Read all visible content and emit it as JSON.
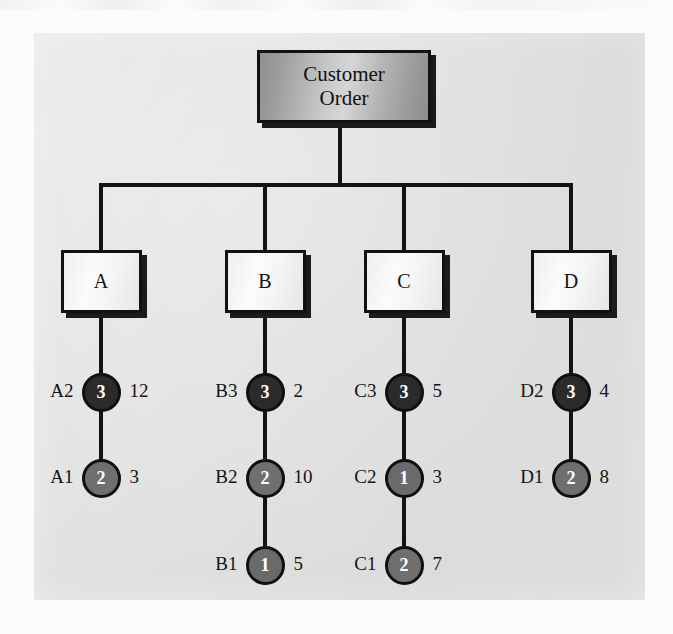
{
  "figure": {
    "panel_background": "#e4e4e4",
    "line_color": "#131313"
  },
  "root": {
    "label_line1": "Customer",
    "label_line2": "Order",
    "fill": "#c0c0c0"
  },
  "branches": [
    {
      "box_label": "A",
      "x_center": 101,
      "items": [
        {
          "id": "A2",
          "level": "3",
          "qty": "12",
          "fill": "#2b2b2b",
          "y": 392
        },
        {
          "id": "A1",
          "level": "2",
          "qty": "3",
          "fill": "#6f6f6f",
          "y": 478
        }
      ]
    },
    {
      "box_label": "B",
      "x_center": 265,
      "items": [
        {
          "id": "B3",
          "level": "3",
          "qty": "2",
          "fill": "#2b2b2b",
          "y": 392
        },
        {
          "id": "B2",
          "level": "2",
          "qty": "10",
          "fill": "#6f6f6f",
          "y": 478
        },
        {
          "id": "B1",
          "level": "1",
          "qty": "5",
          "fill": "#6a6a6a",
          "y": 565
        }
      ]
    },
    {
      "box_label": "C",
      "x_center": 404,
      "items": [
        {
          "id": "C3",
          "level": "3",
          "qty": "5",
          "fill": "#2b2b2b",
          "y": 392
        },
        {
          "id": "C2",
          "level": "1",
          "qty": "3",
          "fill": "#6a6a6a",
          "y": 478
        },
        {
          "id": "C1",
          "level": "2",
          "qty": "7",
          "fill": "#6f6f6f",
          "y": 565
        }
      ]
    },
    {
      "box_label": "D",
      "x_center": 571,
      "items": [
        {
          "id": "D2",
          "level": "3",
          "qty": "4",
          "fill": "#2b2b2b",
          "y": 392
        },
        {
          "id": "D1",
          "level": "2",
          "qty": "8",
          "fill": "#6f6f6f",
          "y": 478
        }
      ]
    }
  ]
}
